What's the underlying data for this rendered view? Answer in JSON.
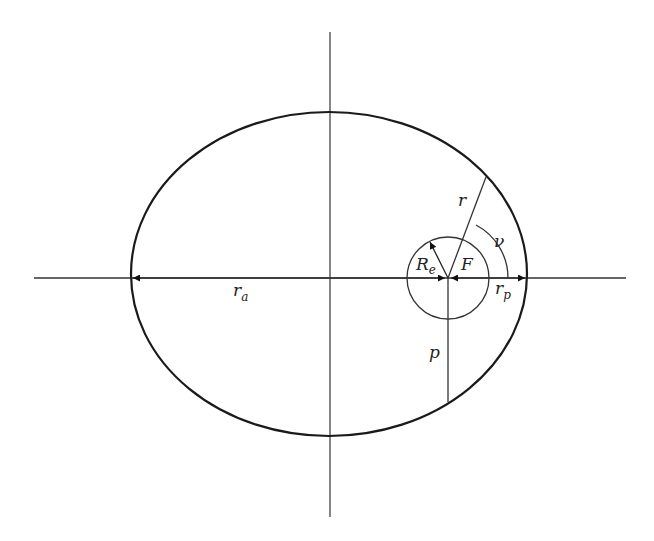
{
  "diagram": {
    "type": "orbital-ellipse",
    "colors": {
      "stroke": "#1a1a1a",
      "axis": "#333333",
      "background": "#ffffff"
    },
    "labels": {
      "r": "r",
      "nu": "ν",
      "R": "R",
      "R_sub": "e",
      "F": "F",
      "r_a": "r",
      "r_a_sub": "a",
      "r_p": "r",
      "r_p_sub": "p",
      "p": "p"
    },
    "elements": {
      "ellipse": {
        "cx": 329,
        "cy": 274,
        "rx": 198,
        "ry": 162
      },
      "focus": {
        "x": 448,
        "y": 278
      },
      "earth_circle_radius": 41,
      "true_anomaly_arc_radius": 60,
      "horizontal_axis": {
        "x1": 34,
        "x2": 626,
        "y": 278
      },
      "vertical_axis": {
        "x": 330,
        "y1": 32,
        "y2": 517
      },
      "radius_vector_end": {
        "x": 486,
        "y": 177
      },
      "semi_latus_rectum_end": {
        "x": 448,
        "y": 402
      }
    }
  }
}
